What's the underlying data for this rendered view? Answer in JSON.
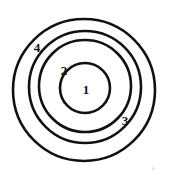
{
  "diagram": {
    "width": 172,
    "height": 182,
    "background_color": "#ffffff",
    "stroke_color": "#111111",
    "label_color": "#141414",
    "rings": [
      {
        "label": "1",
        "name": "innermost-circle",
        "cx": 85,
        "cy": 88,
        "r": 25,
        "stroke_width": 2.6,
        "label_x": 86,
        "label_y": 89,
        "font_size": 13
      },
      {
        "label": "2",
        "name": "second-circle",
        "cx": 85,
        "cy": 86,
        "r": 46,
        "stroke_width": 2.6,
        "label_x": 64,
        "label_y": 70,
        "font_size": 13
      },
      {
        "label": "3",
        "name": "third-circle",
        "cx": 85,
        "cy": 87,
        "r": 56,
        "stroke_width": 2.6,
        "label_x": 125,
        "label_y": 120,
        "font_size": 13
      },
      {
        "label": "4",
        "name": "outermost-circle",
        "cx": 84,
        "cy": 90,
        "r": 71,
        "stroke_width": 2.6,
        "label_x": 37,
        "label_y": 47,
        "font_size": 13
      }
    ],
    "speck": {
      "x": 152,
      "y": 167
    }
  },
  "chart_data": {
    "type": "diagram",
    "subtype": "concentric-circles",
    "xlabel": "",
    "ylabel": "",
    "categories": [
      "1",
      "2",
      "3",
      "4"
    ],
    "values": [
      25,
      46,
      56,
      71
    ],
    "series": [
      {
        "name": "radius_px",
        "values": [
          25,
          46,
          56,
          71
        ]
      }
    ],
    "annotations": [
      "1",
      "2",
      "3",
      "4"
    ],
    "legend": "none",
    "grid": false
  }
}
